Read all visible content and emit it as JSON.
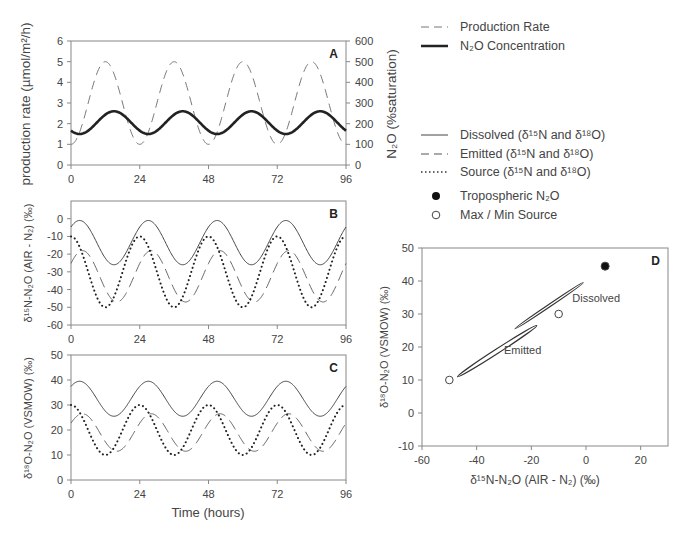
{
  "chart_data": [
    {
      "id": "A",
      "type": "line",
      "panel_label": "A",
      "xlabel": "",
      "ylabel": "production rate (µmol/m²/h)",
      "y2label": "N₂O (%saturation)",
      "xlim": [
        0,
        96
      ],
      "ylim": [
        0,
        6
      ],
      "y2lim": [
        0,
        600
      ],
      "xticks": [
        0,
        24,
        48,
        72,
        96
      ],
      "yticks": [
        0,
        1,
        2,
        3,
        4,
        5,
        6
      ],
      "y2ticks": [
        0,
        100,
        200,
        300,
        400,
        500,
        600
      ],
      "series": [
        {
          "name": "Production Rate",
          "style": "dashed",
          "axis": "left",
          "model": {
            "mean": 3,
            "amp": 2,
            "period": 24,
            "peak_hour": 12
          }
        },
        {
          "name": "N₂O Concentration",
          "style": "thick-solid",
          "axis": "left",
          "model": {
            "mean": 2.05,
            "amp": 0.55,
            "period": 24,
            "peak_hour": 15
          }
        }
      ]
    },
    {
      "id": "B",
      "type": "line",
      "panel_label": "B",
      "ylabel": "δ15N-N₂O (AIR - N₂) (‰)",
      "xlim": [
        0,
        96
      ],
      "ylim": [
        -60,
        10
      ],
      "xticks": [
        0,
        24,
        48,
        72,
        96
      ],
      "yticks": [
        -60,
        -50,
        -40,
        -30,
        -20,
        -10,
        0
      ],
      "series": [
        {
          "name": "Dissolved",
          "style": "solid",
          "model": {
            "mean": -13.5,
            "amp": 12.5,
            "period": 24,
            "peak_hour": 3
          }
        },
        {
          "name": "Emitted",
          "style": "dashed",
          "model": {
            "mean": -32.5,
            "amp": 14.5,
            "period": 24,
            "peak_hour": 4
          }
        },
        {
          "name": "Source",
          "style": "dotted",
          "model": {
            "mean": -30,
            "amp": 20,
            "period": 24,
            "peak_hour": 0
          }
        }
      ]
    },
    {
      "id": "C",
      "type": "line",
      "panel_label": "C",
      "xlabel": "Time (hours)",
      "ylabel": "δ18O-N₂O (VSMOW) (‰)",
      "xlim": [
        0,
        96
      ],
      "ylim": [
        0,
        50
      ],
      "xticks": [
        0,
        24,
        48,
        72,
        96
      ],
      "yticks": [
        0,
        10,
        20,
        30,
        40,
        50
      ],
      "series": [
        {
          "name": "Dissolved",
          "style": "solid",
          "model": {
            "mean": 32.5,
            "amp": 7,
            "period": 24,
            "peak_hour": 3
          }
        },
        {
          "name": "Emitted",
          "style": "dashed",
          "model": {
            "mean": 19,
            "amp": 7.5,
            "period": 24,
            "peak_hour": 4
          }
        },
        {
          "name": "Source",
          "style": "dotted",
          "model": {
            "mean": 20,
            "amp": 10,
            "period": 24,
            "peak_hour": 0
          }
        }
      ]
    },
    {
      "id": "D",
      "type": "scatter",
      "panel_label": "D",
      "xlabel": "δ15N-N₂O (AIR - N₂) (‰)",
      "ylabel": "δ18O-N₂O (VSMOW) (‰)",
      "xlim": [
        -60,
        30
      ],
      "ylim": [
        -10,
        50
      ],
      "xticks": [
        -60,
        -40,
        -20,
        0,
        20
      ],
      "yticks": [
        -10,
        0,
        10,
        20,
        30,
        40,
        50
      ],
      "points": [
        {
          "name": "Tropospheric N₂O",
          "x": 7,
          "y": 44.5,
          "marker": "filled-circle"
        },
        {
          "name": "Max Source",
          "x": -10,
          "y": 30,
          "marker": "open-circle"
        },
        {
          "name": "Min Source",
          "x": -50,
          "y": 10,
          "marker": "open-circle"
        }
      ],
      "annotations": [
        {
          "text": "Dissolved",
          "x": -5,
          "y": 35
        },
        {
          "text": "Emitted",
          "x": -30,
          "y": 19
        }
      ],
      "loops": [
        {
          "name": "Dissolved",
          "from": [
            -26,
            25.5
          ],
          "to": [
            -1,
            39.5
          ]
        },
        {
          "name": "Emitted",
          "from": [
            -47,
            11
          ],
          "to": [
            -18,
            26.5
          ]
        }
      ]
    }
  ],
  "legend": {
    "top": [
      {
        "label": "Production Rate",
        "style": "dashed"
      },
      {
        "label": "N₂O Concentration",
        "style": "thick-solid"
      }
    ],
    "middle": [
      {
        "label": "Dissolved (δ15N and δ18O)",
        "style": "solid"
      },
      {
        "label": "Emitted (δ15N and δ18O)",
        "style": "dashed"
      },
      {
        "label": "Source (δ15N and δ18O)",
        "style": "dotted"
      }
    ],
    "markers": [
      {
        "label": "Tropospheric N₂O",
        "marker": "filled-circle"
      },
      {
        "label": "Max / Min Source",
        "marker": "open-circle"
      }
    ]
  },
  "text": {
    "panelA_ylabel": "production rate (µmol/m²/h)",
    "panelA_y2label": "N₂O (%saturation)",
    "panelB_ylabel": "δ¹⁵N-N₂O (AIR - N₂) (‰)",
    "panelC_ylabel": "δ¹⁸O-N₂O (VSMOW) (‰)",
    "panelC_xlabel": "Time (hours)",
    "panelD_ylabel": "δ¹⁸O-N₂O (VSMOW) (‰)",
    "panelD_xlabel": "δ¹⁵N-N₂O (AIR - N₂) (‰)",
    "legend_prod": "Production Rate",
    "legend_conc": "N₂O Concentration",
    "legend_diss": "Dissolved (δ¹⁵N and δ¹⁸O)",
    "legend_emit": "Emitted (δ¹⁵N and δ¹⁸O)",
    "legend_src": "Source (δ¹⁵N and δ¹⁸O)",
    "legend_trop": "Tropospheric N₂O",
    "legend_maxmin": "Max / Min Source",
    "annot_dissolved": "Dissolved",
    "annot_emitted": "Emitted"
  }
}
